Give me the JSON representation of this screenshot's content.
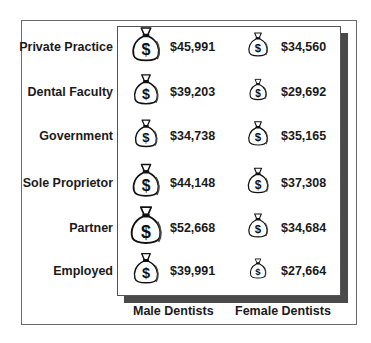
{
  "chart_data": {
    "type": "table",
    "title": "",
    "categories": [
      "Private Practice",
      "Dental Faculty",
      "Government",
      "Sole Proprietor",
      "Partner",
      "Employed"
    ],
    "series": [
      {
        "name": "Male Dentists",
        "values": [
          45991,
          39203,
          34738,
          44148,
          52668,
          39991
        ],
        "labels": [
          "$45,991",
          "$39,203",
          "$34,738",
          "$44,148",
          "$52,668",
          "$39,991"
        ]
      },
      {
        "name": "Female Dentists",
        "values": [
          34560,
          29692,
          35165,
          37308,
          34684,
          27664
        ],
        "labels": [
          "$34,560",
          "$29,692",
          "$35,165",
          "$37,308",
          "$34,684",
          "$27,664"
        ]
      }
    ],
    "icon": "money-bag-icon",
    "encoding": "money bag icon size scales with salary",
    "xlabel": "",
    "ylabel": ""
  },
  "rows": [
    {
      "label": "Private Practice",
      "male": "$45,991",
      "female": "$34,560"
    },
    {
      "label": "Dental Faculty",
      "male": "$39,203",
      "female": "$29,692"
    },
    {
      "label": "Government",
      "male": "$34,738",
      "female": "$35,165"
    },
    {
      "label": "Sole Proprietor",
      "male": "$44,148",
      "female": "$37,308"
    },
    {
      "label": "Partner",
      "male": "$52,668",
      "female": "$34,684"
    },
    {
      "label": "Employed",
      "male": "$39,991",
      "female": "$27,664"
    }
  ],
  "columns": {
    "male": "Male Dentists",
    "female": "Female Dentists"
  }
}
